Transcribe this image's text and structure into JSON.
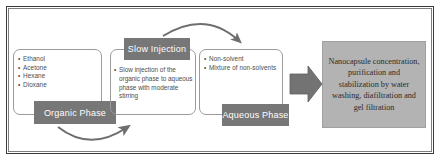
{
  "figure": {
    "colors": {
      "label_box": "#777777",
      "result_box": "#b3b3b3",
      "panel_outline": "#9b9b9b",
      "arrow": "#6e6e6e",
      "block_arrow": "#737373",
      "frame": "#3a3a3a",
      "text_dark": "#2b2b2b",
      "text_gray": "#4c4c4c",
      "label_text": "#ffffff",
      "background": "#ffffff"
    }
  },
  "organic_phase": {
    "label": "Organic Phase",
    "bullets": [
      "Ethanol",
      "Acetone",
      "Hexane",
      "Dioxane"
    ]
  },
  "slow_injection": {
    "label": "Slow Injection",
    "bullets": [
      "Slow injection of the organic phase to aqueous phase with moderate stirring"
    ]
  },
  "aqueous_phase": {
    "label": "Aqueous Phase",
    "bullets": [
      "Non-solvent",
      "Mixture of non-solvents"
    ]
  },
  "result": {
    "text": "Nanocapsule concentration, purification and stabilization by water washing, diafiltration and gel filtration"
  },
  "connectors": {
    "organic_to_slow": "curved-arrow-bottom",
    "slow_to_aqueous": "curved-arrow-top",
    "aqueous_to_result": "block-arrow-right"
  }
}
